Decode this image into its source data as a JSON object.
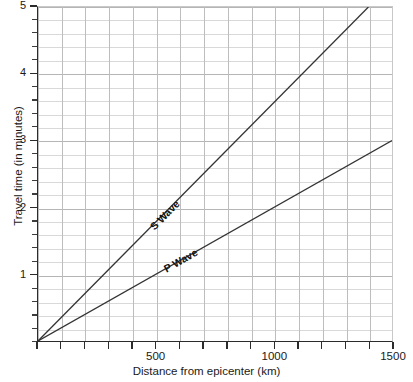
{
  "chart_data": {
    "type": "line",
    "title": "",
    "xlabel": "Distance from epicenter (km)",
    "ylabel": "Travel time (in minutes)",
    "xlim": [
      0,
      1500
    ],
    "ylim": [
      0,
      5
    ],
    "grid": true,
    "legend_position": "inline-annotation",
    "x_major_ticks": [
      0,
      100,
      200,
      300,
      400,
      500,
      600,
      700,
      800,
      900,
      1000,
      1100,
      1200,
      1300,
      1400,
      1500
    ],
    "x_tick_labels": [
      {
        "value": 500,
        "label": "500"
      },
      {
        "value": 1000,
        "label": "1000"
      },
      {
        "value": 1500,
        "label": "1500"
      }
    ],
    "y_major_ticks": [
      1,
      2,
      3,
      4,
      5
    ],
    "y_tick_labels": [
      {
        "value": 1,
        "label": "1"
      },
      {
        "value": 2,
        "label": "2"
      },
      {
        "value": 3,
        "label": "3"
      },
      {
        "value": 4,
        "label": "4"
      },
      {
        "value": 5,
        "label": "5"
      }
    ],
    "y_minor_step": 0.2,
    "x_gridline_step": 100,
    "series": [
      {
        "name": "S Wave",
        "label": "S Wave",
        "color": "#333333",
        "points": [
          [
            0,
            0
          ],
          [
            1400,
            5
          ]
        ],
        "slope_min_per_km": 0.003571,
        "label_anchor": [
          620,
          2.18
        ]
      },
      {
        "name": "P Wave",
        "label": "P Wave",
        "color": "#333333",
        "points": [
          [
            0,
            0
          ],
          [
            1500,
            3
          ]
        ],
        "slope_min_per_km": 0.002,
        "label_anchor": [
          690,
          1.42
        ]
      }
    ],
    "colors": {
      "grid_minor": "#d9d9d9",
      "grid_major": "#b5b5b5",
      "axis": "#2b2b2b",
      "series": "#333333",
      "background": "#ffffff",
      "text": "#1a1a1a"
    }
  }
}
